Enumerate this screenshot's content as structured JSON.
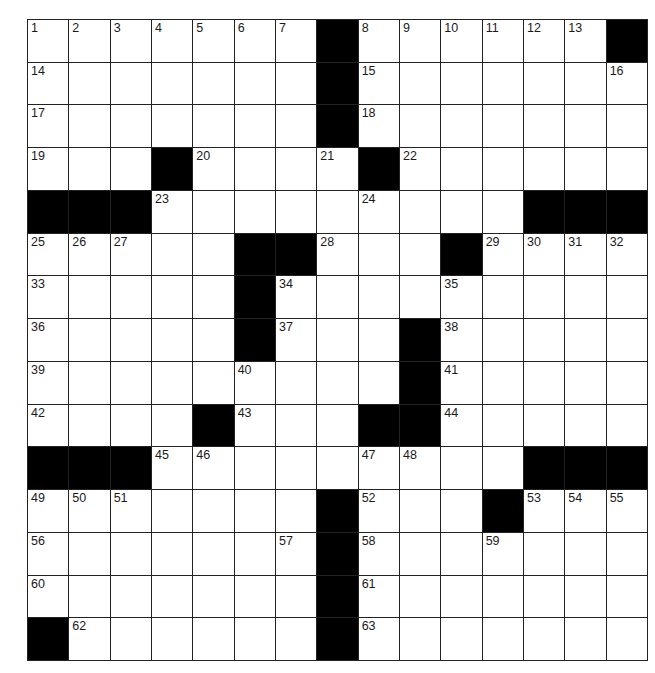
{
  "puzzle": {
    "rows": 15,
    "cols": 15,
    "colors": {
      "block": "#000000",
      "cell": "#ffffff",
      "line": "#222222",
      "number": "#1a1a1a"
    },
    "grid": [
      ".......#......#",
      ".......#.......",
      ".......#.......",
      "...#....#......",
      "###.........###",
      ".....##...#....",
      ".....#.........",
      ".....#...#.....",
      ".........#.....",
      "....#...##.....",
      "###.........###",
      ".......#...#...",
      ".......#.......",
      ".......#.......",
      "#......#......."
    ],
    "numbers": [
      [
        1,
        2,
        3,
        4,
        5,
        6,
        7,
        0,
        8,
        9,
        10,
        11,
        12,
        13,
        0
      ],
      [
        14,
        0,
        0,
        0,
        0,
        0,
        0,
        0,
        15,
        0,
        0,
        0,
        0,
        0,
        16
      ],
      [
        17,
        0,
        0,
        0,
        0,
        0,
        0,
        0,
        18,
        0,
        0,
        0,
        0,
        0,
        0
      ],
      [
        19,
        0,
        0,
        0,
        20,
        0,
        0,
        21,
        0,
        22,
        0,
        0,
        0,
        0,
        0
      ],
      [
        0,
        0,
        0,
        23,
        0,
        0,
        0,
        0,
        24,
        0,
        0,
        0,
        0,
        0,
        0
      ],
      [
        25,
        26,
        27,
        0,
        0,
        0,
        0,
        28,
        0,
        0,
        0,
        29,
        30,
        31,
        32
      ],
      [
        33,
        0,
        0,
        0,
        0,
        0,
        34,
        0,
        0,
        0,
        35,
        0,
        0,
        0,
        0
      ],
      [
        36,
        0,
        0,
        0,
        0,
        0,
        37,
        0,
        0,
        0,
        38,
        0,
        0,
        0,
        0
      ],
      [
        39,
        0,
        0,
        0,
        0,
        40,
        0,
        0,
        0,
        0,
        41,
        0,
        0,
        0,
        0
      ],
      [
        42,
        0,
        0,
        0,
        0,
        43,
        0,
        0,
        0,
        0,
        44,
        0,
        0,
        0,
        0
      ],
      [
        0,
        0,
        0,
        45,
        46,
        0,
        0,
        0,
        47,
        48,
        0,
        0,
        0,
        0,
        0
      ],
      [
        49,
        50,
        51,
        0,
        0,
        0,
        0,
        0,
        52,
        0,
        0,
        0,
        53,
        54,
        55
      ],
      [
        56,
        0,
        0,
        0,
        0,
        0,
        57,
        0,
        58,
        0,
        0,
        59,
        0,
        0,
        0
      ],
      [
        60,
        0,
        0,
        0,
        0,
        0,
        0,
        0,
        61,
        0,
        0,
        0,
        0,
        0,
        0
      ],
      [
        0,
        62,
        0,
        0,
        0,
        0,
        0,
        0,
        63,
        0,
        0,
        0,
        0,
        0,
        0
      ]
    ]
  }
}
